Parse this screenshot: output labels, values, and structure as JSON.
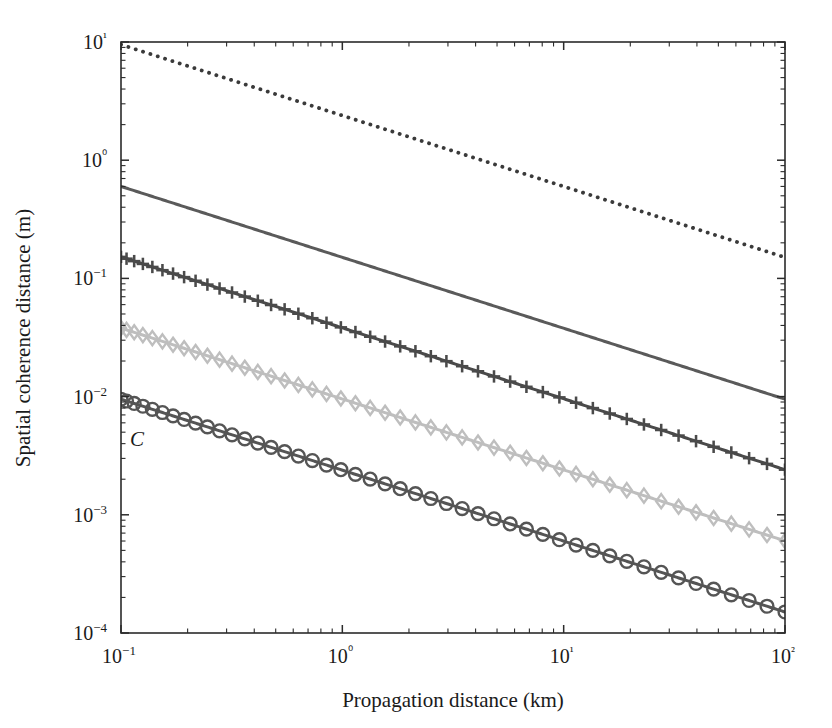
{
  "chart_data": {
    "type": "line",
    "title": "",
    "xlabel": "Propagation distance (km)",
    "ylabel": "Spatial coherence distance (m)",
    "xscale": "log",
    "yscale": "log",
    "xlim": [
      0.1,
      100
    ],
    "ylim": [
      0.0001,
      10
    ],
    "grid": false,
    "x_tick_labels": [
      "10−1",
      "10⁰",
      "10¹",
      "10²"
    ],
    "x_ticks": [
      0.1,
      1,
      10,
      100
    ],
    "y_tick_labels": [
      "10⁴",
      "10⁳",
      "10⁲",
      "10ⁱ",
      "10⁰",
      "10¹"
    ],
    "y_ticks": [
      0.0001,
      0.001,
      0.01,
      0.1,
      1,
      10
    ],
    "legend": {
      "position": "lower-left-inside",
      "title_base": "C",
      "title_sup": "2",
      "title_sub": "n",
      "entries": [
        {
          "mantissa": "10",
          "exponent": "−17",
          "unit": "m",
          "unit_exponent": "−2/3",
          "style": "dotted",
          "marker": "none",
          "color": "#3a3a3a"
        },
        {
          "mantissa": "10",
          "exponent": "−15",
          "unit": "m",
          "unit_exponent": "−2/3",
          "style": "solid",
          "marker": "none",
          "color": "#5a5a5a"
        },
        {
          "mantissa": "10",
          "exponent": "−14",
          "unit": "m",
          "unit_exponent": "−2/3",
          "style": "solid",
          "marker": "plus",
          "color": "#4a4a4a"
        },
        {
          "mantissa": "10",
          "exponent": "−13",
          "unit": "m",
          "unit_exponent": "−2/3",
          "style": "solid",
          "marker": "diamond",
          "color": "#bebebe"
        },
        {
          "mantissa": "10",
          "exponent": "−12",
          "unit": "m",
          "unit_exponent": "−2/3",
          "style": "solid",
          "marker": "circle",
          "color": "#555555"
        }
      ]
    },
    "series": [
      {
        "name": "Cn2 = 1e-17 m^-2/3",
        "slope": -0.6,
        "y_at_0.1km": 9.5,
        "y_at_100km": 0.15,
        "style": "dotted",
        "marker": "none",
        "color": "#3a3a3a",
        "width": 3.2
      },
      {
        "name": "Cn2 = 1e-15 m^-2/3",
        "slope": -0.6,
        "y_at_0.1km": 0.6,
        "y_at_100km": 0.0095,
        "style": "solid",
        "marker": "none",
        "color": "#5a5a5a",
        "width": 3.0
      },
      {
        "name": "Cn2 = 1e-14 m^-2/3",
        "slope": -0.6,
        "y_at_0.1km": 0.152,
        "y_at_100km": 0.0024,
        "style": "solid",
        "marker": "plus",
        "color": "#4a4a4a",
        "width": 3.0
      },
      {
        "name": "Cn2 = 1e-13 m^-2/3",
        "slope": -0.6,
        "y_at_0.1km": 0.038,
        "y_at_100km": 0.0006,
        "style": "solid",
        "marker": "diamond",
        "color": "#bebebe",
        "width": 3.0
      },
      {
        "name": "Cn2 = 1e-12 m^-2/3",
        "slope": -0.6,
        "y_at_0.1km": 0.0095,
        "y_at_100km": 0.00015,
        "style": "solid",
        "marker": "circle",
        "color": "#555555",
        "width": 3.0
      }
    ]
  },
  "axes": {
    "x_title": "Propagation distance (km)",
    "y_title": "Spatial coherence distance (m)"
  }
}
